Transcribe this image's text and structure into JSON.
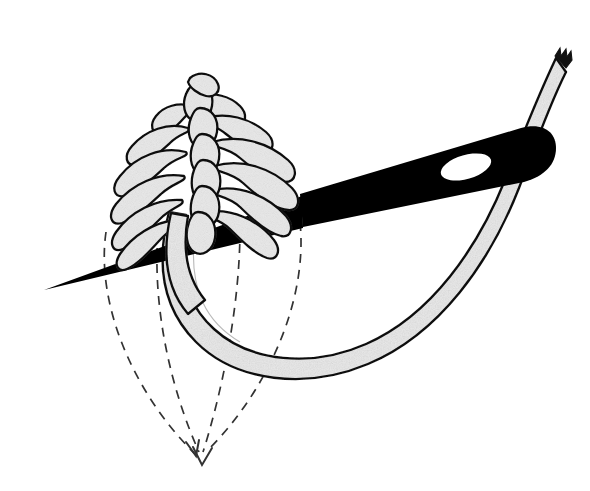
{
  "document": {
    "title": "Feather Stitch Embroidery Diagram",
    "background_color": "#ffffff",
    "width": 590,
    "height": 491,
    "style": "black-and-white line illustration, stippled gray fill"
  },
  "palette": {
    "ink": "#1a1a1a",
    "outline": "#111111",
    "thread_fill": "#e9e9e9",
    "thread_fill_shade": "#dcdcdc",
    "needle_fill": "#000000",
    "needle_eye_fill": "#ffffff",
    "guide_line": "#333333",
    "paper": "#ffffff"
  },
  "figure": {
    "name": "feather-stitch-diagram",
    "caption": ""
  },
  "elements": {
    "needle": {
      "label": "curved sewing needle",
      "fill": "#000000",
      "tip_point": [
        44,
        290
      ],
      "shaft_start": [
        300,
        216
      ],
      "shaft_end": [
        537,
        146
      ],
      "eye": {
        "label": "needle eye",
        "center": [
          466,
          167
        ],
        "rx": 26,
        "ry": 12,
        "rotation": -16,
        "fill": "#ffffff"
      }
    },
    "thread": {
      "label": "working thread loop",
      "fill": "#e9e9e9",
      "outline": "#111111",
      "band_width": 17,
      "free_end": {
        "label": "frayed thread end",
        "point": [
          556,
          44
        ],
        "style": "jagged"
      },
      "loop_bottom": [
        320,
        330
      ]
    },
    "stitch": {
      "label": "feather stitch chain",
      "fill": "#e9e9e9",
      "outline": "#111111",
      "arm_count": 13,
      "spine_top": [
        198,
        88
      ],
      "spine_bottom": [
        205,
        245
      ],
      "arms_left": 6,
      "arms_right": 7
    },
    "guide_lines": {
      "label": "dashed guide lines",
      "color": "#333333",
      "dash": "9 7",
      "count": 4,
      "converge_point": [
        201,
        462
      ],
      "arrowheads": 2,
      "origins": [
        [
          106,
          232
        ],
        [
          158,
          232
        ],
        [
          240,
          228
        ],
        [
          300,
          222
        ]
      ]
    }
  }
}
